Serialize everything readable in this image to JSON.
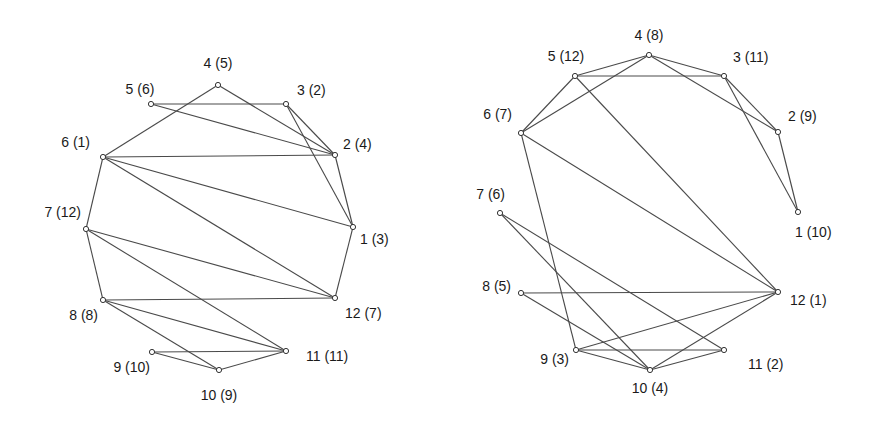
{
  "colors": {
    "edge": "#4a4a4a",
    "node_stroke": "#333333",
    "text": "#1a1a1a",
    "background": "#ffffff"
  },
  "graphs": [
    {
      "id": "left-graph",
      "nodes": [
        {
          "id": 1,
          "label": "1 (3)",
          "x": 353,
          "y": 227,
          "lx": 360,
          "ly": 244,
          "anchor": "start"
        },
        {
          "id": 2,
          "label": "2 (4)",
          "x": 335,
          "y": 155,
          "lx": 343,
          "ly": 149,
          "anchor": "start"
        },
        {
          "id": 3,
          "label": "3 (2)",
          "x": 286,
          "y": 104,
          "lx": 297,
          "ly": 95,
          "anchor": "start"
        },
        {
          "id": 4,
          "label": "4 (5)",
          "x": 218,
          "y": 85,
          "lx": 218,
          "ly": 68,
          "anchor": "middle"
        },
        {
          "id": 5,
          "label": "5 (6)",
          "x": 151,
          "y": 104,
          "lx": 140,
          "ly": 94,
          "anchor": "middle"
        },
        {
          "id": 6,
          "label": "6 (1)",
          "x": 103,
          "y": 157,
          "lx": 90,
          "ly": 147,
          "anchor": "end"
        },
        {
          "id": 7,
          "label": "7 (12)",
          "x": 86,
          "y": 229,
          "lx": 81,
          "ly": 217,
          "anchor": "end"
        },
        {
          "id": 8,
          "label": "8 (8)",
          "x": 103,
          "y": 300,
          "lx": 98,
          "ly": 320,
          "anchor": "end"
        },
        {
          "id": 9,
          "label": "9 (10)",
          "x": 152,
          "y": 352,
          "lx": 150,
          "ly": 372,
          "anchor": "end"
        },
        {
          "id": 10,
          "label": "10 (9)",
          "x": 219,
          "y": 370,
          "lx": 219,
          "ly": 400,
          "anchor": "middle"
        },
        {
          "id": 11,
          "label": "11 (11)",
          "x": 286,
          "y": 351,
          "lx": 306,
          "ly": 361,
          "anchor": "start"
        },
        {
          "id": 12,
          "label": "12 (7)",
          "x": 335,
          "y": 298,
          "lx": 345,
          "ly": 318,
          "anchor": "start"
        }
      ],
      "edges": [
        [
          3,
          5
        ],
        [
          3,
          2
        ],
        [
          3,
          1
        ],
        [
          4,
          6
        ],
        [
          4,
          2
        ],
        [
          5,
          2
        ],
        [
          6,
          2
        ],
        [
          6,
          1
        ],
        [
          6,
          12
        ],
        [
          6,
          7
        ],
        [
          2,
          1
        ],
        [
          1,
          12
        ],
        [
          7,
          12
        ],
        [
          7,
          11
        ],
        [
          7,
          8
        ],
        [
          8,
          12
        ],
        [
          8,
          11
        ],
        [
          8,
          10
        ],
        [
          9,
          11
        ],
        [
          9,
          10
        ],
        [
          10,
          11
        ]
      ]
    },
    {
      "id": "right-graph",
      "nodes": [
        {
          "id": 1,
          "label": "1 (10)",
          "x": 798,
          "y": 212,
          "lx": 795,
          "ly": 237,
          "anchor": "start"
        },
        {
          "id": 2,
          "label": "2 (9)",
          "x": 778,
          "y": 132,
          "lx": 788,
          "ly": 121,
          "anchor": "start"
        },
        {
          "id": 3,
          "label": "3 (11)",
          "x": 724,
          "y": 76,
          "lx": 733,
          "ly": 62,
          "anchor": "start"
        },
        {
          "id": 4,
          "label": "4 (8)",
          "x": 649,
          "y": 55,
          "lx": 649,
          "ly": 40,
          "anchor": "middle"
        },
        {
          "id": 5,
          "label": "5 (12)",
          "x": 575,
          "y": 76,
          "lx": 566,
          "ly": 61,
          "anchor": "middle"
        },
        {
          "id": 6,
          "label": "6 (7)",
          "x": 521,
          "y": 133,
          "lx": 512,
          "ly": 119,
          "anchor": "end"
        },
        {
          "id": 7,
          "label": "7 (6)",
          "x": 500,
          "y": 213,
          "lx": 505,
          "ly": 199,
          "anchor": "end"
        },
        {
          "id": 8,
          "label": "8 (5)",
          "x": 521,
          "y": 293,
          "lx": 511,
          "ly": 291,
          "anchor": "end"
        },
        {
          "id": 9,
          "label": "9 (3)",
          "x": 576,
          "y": 350,
          "lx": 569,
          "ly": 364,
          "anchor": "end"
        },
        {
          "id": 10,
          "label": "10 (4)",
          "x": 650,
          "y": 370,
          "lx": 650,
          "ly": 393,
          "anchor": "middle"
        },
        {
          "id": 11,
          "label": "11 (2)",
          "x": 724,
          "y": 350,
          "lx": 748,
          "ly": 369,
          "anchor": "start"
        },
        {
          "id": 12,
          "label": "12 (1)",
          "x": 778,
          "y": 292,
          "lx": 790,
          "ly": 305,
          "anchor": "start"
        }
      ],
      "edges": [
        [
          5,
          4
        ],
        [
          5,
          3
        ],
        [
          5,
          6
        ],
        [
          5,
          12
        ],
        [
          4,
          6
        ],
        [
          4,
          3
        ],
        [
          4,
          2
        ],
        [
          3,
          2
        ],
        [
          3,
          1
        ],
        [
          2,
          1
        ],
        [
          6,
          12
        ],
        [
          6,
          9
        ],
        [
          7,
          10
        ],
        [
          7,
          11
        ],
        [
          8,
          12
        ],
        [
          8,
          10
        ],
        [
          9,
          12
        ],
        [
          9,
          11
        ],
        [
          9,
          10
        ],
        [
          10,
          12
        ],
        [
          10,
          11
        ]
      ]
    }
  ]
}
